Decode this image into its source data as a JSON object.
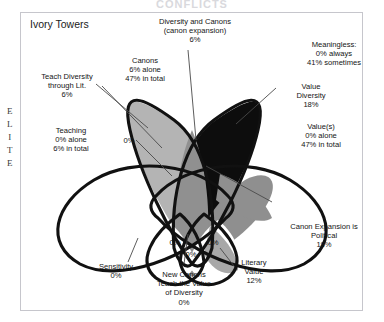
{
  "figure": {
    "top_title_cutoff": "CONFLICTS",
    "axis_label_vertical": "ELITE",
    "axis_letters": [
      "E",
      "L",
      "I",
      "T",
      "E"
    ],
    "panel_title": "Ivory Towers"
  },
  "colors": {
    "outline": "#111111",
    "canons_fill": "#b4b4b4",
    "diversity_fill": "#0d0d0d",
    "overlap_mid": "#8f8f8f",
    "overlap_light": "#a9a9a9",
    "overlap_dark": "#6f6f6f",
    "white_fill": "#ffffff",
    "frame_border": "#c6c6cc",
    "text": "#141414",
    "text_on_dark": "#ffffff"
  },
  "chart_data": {
    "type": "diagram",
    "subtype": "venn-petal",
    "title": "Ivory Towers",
    "axis_label": "ELITE",
    "regions": [
      {
        "id": "canons",
        "name": "Canons",
        "lines": [
          "Canons",
          "6% alone",
          "47% in total"
        ],
        "alone_pct": 6,
        "total_pct": 47,
        "fill": "light-gray",
        "label_color": "dark"
      },
      {
        "id": "diversity",
        "name": "Diversity",
        "lines": [
          "Diversity",
          "35% alone",
          "82% in total"
        ],
        "alone_pct": 35,
        "total_pct": 82,
        "fill": "black",
        "label_color": "white"
      },
      {
        "id": "teaching",
        "name": "Teaching",
        "lines": [
          "Teaching",
          "0% alone",
          "6% in total"
        ],
        "alone_pct": 0,
        "total_pct": 6,
        "fill": "white",
        "label_color": "dark"
      },
      {
        "id": "values",
        "name": "Value(s)",
        "lines": [
          "Value(s)",
          "0% alone",
          "47% in total"
        ],
        "alone_pct": 0,
        "total_pct": 47,
        "fill": "white",
        "label_color": "dark"
      }
    ],
    "callouts": [
      {
        "id": "diversity-and-canons",
        "lines": [
          "Diversity and Canons",
          "(canon expansion)",
          "6%"
        ],
        "value_pct": 6,
        "position": "top-center"
      },
      {
        "id": "meaningless",
        "lines": [
          "Meaningless:",
          "0% always",
          "41% sometimes"
        ],
        "always_pct": 0,
        "sometimes_pct": 41,
        "position": "top-right"
      },
      {
        "id": "teach-diversity-through-lit",
        "lines": [
          "Teach Diversity",
          "through Lit.",
          "6%"
        ],
        "value_pct": 6,
        "position": "left"
      },
      {
        "id": "value-diversity",
        "lines": [
          "Value",
          "Diversity",
          "18%"
        ],
        "value_pct": 18,
        "position": "right"
      },
      {
        "id": "canon-expansion-is-political",
        "lines": [
          "Canon Expansion is",
          "Political",
          "18%"
        ],
        "value_pct": 18,
        "position": "bottom-right"
      },
      {
        "id": "sensitivity",
        "lines": [
          "Sensitivity",
          "0%"
        ],
        "value_pct": 0,
        "position": "bottom-left"
      },
      {
        "id": "new-canons-teach-value-of-diversity",
        "lines": [
          "New Canons",
          "Teach the Value",
          "of Diversity",
          "0%"
        ],
        "value_pct": 0,
        "position": "bottom-center"
      },
      {
        "id": "literary-value",
        "lines": [
          "Literary",
          "Value",
          "12%"
        ],
        "value_pct": 12,
        "position": "bottom-center-right"
      }
    ],
    "inline_zero_labels": [
      {
        "id": "zero-upper-left",
        "text": "0%"
      },
      {
        "id": "zero-lower-left",
        "text": "0%"
      },
      {
        "id": "zero-lower-right",
        "text": "0%"
      },
      {
        "id": "zero-bottom-center",
        "text": "0%"
      }
    ]
  },
  "labels": {
    "canons": {
      "l1": "Canons",
      "l2": "6% alone",
      "l3": "47% in total"
    },
    "diversity": {
      "l1": "Diversity",
      "l2": "35% alone",
      "l3": "82% in total"
    },
    "teaching": {
      "l1": "Teaching",
      "l2": "0% alone",
      "l3": "6% in total"
    },
    "values": {
      "l1": "Value(s)",
      "l2": "0% alone",
      "l3": "47% in total"
    },
    "diversity_and_canons": {
      "l1": "Diversity and Canons",
      "l2": "(canon expansion)",
      "l3": "6%"
    },
    "meaningless": {
      "l1": "Meaningless:",
      "l2": "0% always",
      "l3": "41% sometimes"
    },
    "teach_diversity": {
      "l1": "Teach Diversity",
      "l2": "through Lit.",
      "l3": "6%"
    },
    "value_diversity": {
      "l1": "Value",
      "l2": "Diversity",
      "l3": "18%"
    },
    "canon_expansion": {
      "l1": "Canon Expansion is",
      "l2": "Political",
      "l3": "18%"
    },
    "sensitivity": {
      "l1": "Sensitivity",
      "l2": "0%"
    },
    "new_canons": {
      "l1": "New Canons",
      "l2": "Teach the Value",
      "l3": "of Diversity",
      "l4": "0%"
    },
    "literary_value": {
      "l1": "Literary",
      "l2": "Value",
      "l3": "12%"
    },
    "zero_a": "0%",
    "zero_b": "0%",
    "zero_c": "0%",
    "zero_d": "0%"
  }
}
